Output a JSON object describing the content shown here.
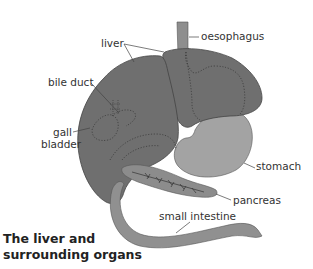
{
  "title": {
    "line1": "The liver and",
    "line2": "surrounding organs"
  },
  "labels": {
    "liver": "liver",
    "oesophagus": "oesophagus",
    "bile_duct": "bile duct",
    "gall_bladder_line1": "gall",
    "gall_bladder_line2": "bladder",
    "stomach": "stomach",
    "pancreas": "pancreas",
    "small_intestine": "small intestine"
  },
  "colors": {
    "liver": "#6f6f6f",
    "stomach": "#a3a3a3",
    "pancreas": "#8c8c8c",
    "intestine": "#909090",
    "oesophagus": "#8e8e8e",
    "outline": "#444444",
    "label_text": "#333333"
  }
}
